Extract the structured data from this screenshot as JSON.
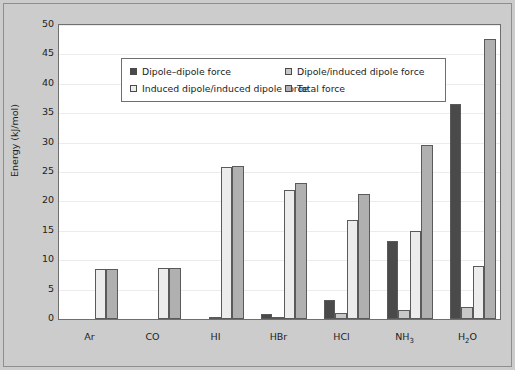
{
  "chart_data": {
    "type": "bar",
    "title": "",
    "xlabel": "",
    "ylabel": "Energy (kJ/mol)",
    "ylim": [
      0,
      50
    ],
    "ytick_step": 5,
    "yticks": [
      0,
      5,
      10,
      15,
      20,
      25,
      30,
      35,
      40,
      45,
      50
    ],
    "ytick_labels": [
      "0",
      "5",
      "10",
      "15",
      "20",
      "25",
      "30",
      "35",
      "40",
      "45",
      "50"
    ],
    "grid": true,
    "grid_axis": "y",
    "legend_position": "upper-left-inside",
    "categories": [
      "Ar",
      "CO",
      "HI",
      "HBr",
      "HCl",
      "NH3",
      "H2O"
    ],
    "category_labels_html": [
      "Ar",
      "CO",
      "HI",
      "HBr",
      "HCl",
      "NH<sub>3</sub>",
      "H<sub>2</sub>O"
    ],
    "series": [
      {
        "name": "Dipole–dipole force",
        "color": "#4a4a4a",
        "values": [
          0,
          0,
          0.03,
          0.8,
          3.3,
          13.3,
          36.6
        ]
      },
      {
        "name": "Dipole/induced dipole force",
        "color": "#c8c8c8",
        "values": [
          0,
          0,
          0.1,
          0.3,
          1.0,
          1.5,
          2.0
        ]
      },
      {
        "name": "Induced dipole/induced dipole force",
        "color": "#ececec",
        "values": [
          8.5,
          8.75,
          25.9,
          21.9,
          16.8,
          14.9,
          9.0
        ]
      },
      {
        "name": "Total force",
        "color": "#b0b0b0",
        "values": [
          8.5,
          8.75,
          26.0,
          23.1,
          21.2,
          29.6,
          47.6
        ]
      }
    ]
  },
  "legend": {
    "entries": [
      {
        "label": "Dipole–dipole force",
        "color": "#4a4a4a"
      },
      {
        "label": "Dipole/induced dipole force",
        "color": "#c8c8c8"
      },
      {
        "label": "Induced dipole/induced dipole force",
        "color": "#ececec"
      },
      {
        "label": "Total force",
        "color": "#b0b0b0"
      }
    ]
  },
  "axis": {
    "y_title": "Energy (kJ/mol)"
  },
  "style": {
    "figure_background": "#cccccc",
    "plot_background": "#ffffff",
    "frame_color": "#6f6f6f",
    "gridline_color": "#ececec",
    "bar_edge_color": "#5a5a5a",
    "text_color": "#1c1c1c"
  }
}
